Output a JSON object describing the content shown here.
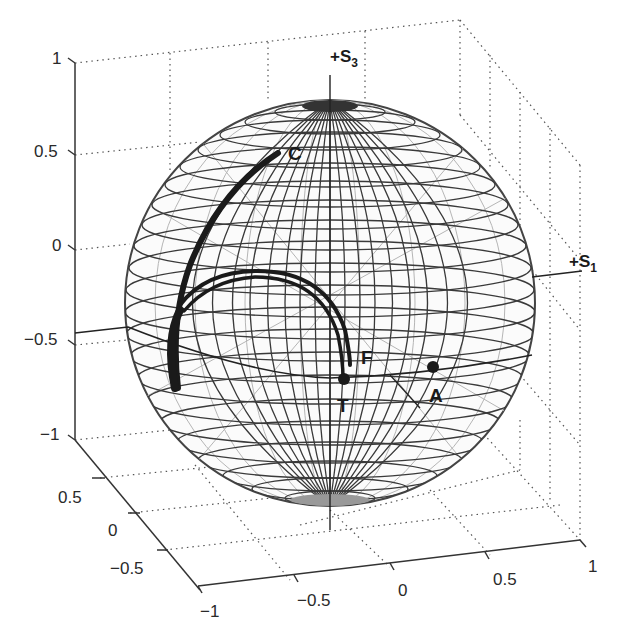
{
  "figure": {
    "type": "3d wireframe sphere"
  },
  "axes": {
    "z_ticks": [
      "1",
      "0.5",
      "0",
      "−0.5",
      "−1"
    ],
    "y_ticks": [
      "0.5",
      "0",
      "−0.5"
    ],
    "x_ticks": [
      "−1",
      "−0.5",
      "0",
      "0.5",
      "1"
    ],
    "s3_label": "+S",
    "s3_sub": "3",
    "s1_label": "+S",
    "s1_sub": "1"
  },
  "points": {
    "C": "C",
    "F": "F",
    "T": "T",
    "A": "A"
  },
  "colors": {
    "grid_dark": "#3a3a3a",
    "grid_light": "#9a9a9a",
    "trajectory": "#1a1a1a",
    "background": "#ffffff"
  }
}
